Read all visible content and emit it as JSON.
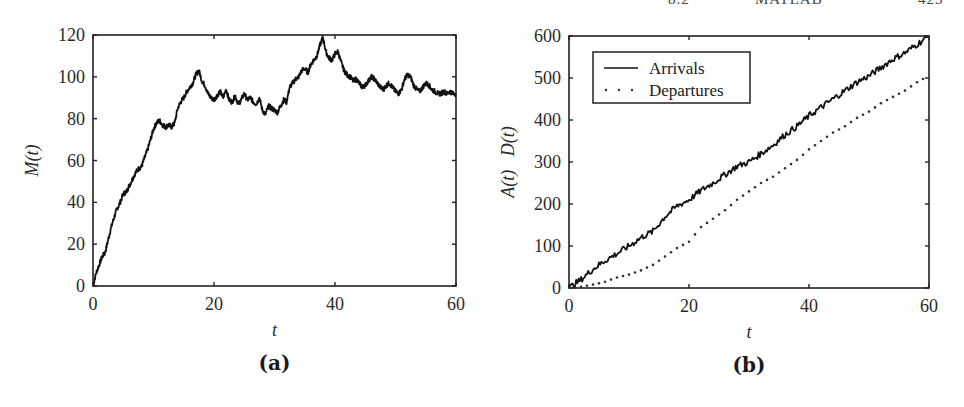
{
  "page_header": {
    "fragments": [
      "8.2",
      "MATLAB",
      "423"
    ]
  },
  "chart_data": [
    {
      "id": "a",
      "type": "line",
      "caption": "(a)",
      "title": "",
      "xlabel": "t",
      "ylabel": "M(t)",
      "xlim": [
        0,
        60
      ],
      "ylim": [
        0,
        120
      ],
      "xticks": [
        0,
        20,
        40,
        60
      ],
      "yticks": [
        0,
        20,
        40,
        60,
        80,
        100,
        120
      ],
      "grid": false,
      "legend": null,
      "box": {
        "left": 93,
        "top": 35,
        "right": 456,
        "bottom": 286
      },
      "series": [
        {
          "name": "M(t)",
          "style": "solid",
          "color": "#111111",
          "x": [
            0,
            0.5,
            1,
            1.5,
            2,
            2.5,
            3,
            3.5,
            4,
            4.5,
            5,
            5.5,
            6,
            6.5,
            7,
            7.5,
            8,
            8.5,
            9,
            9.5,
            10,
            10.5,
            11,
            11.5,
            12,
            12.5,
            13,
            13.5,
            14,
            14.5,
            15,
            15.5,
            16,
            16.5,
            17,
            17.5,
            18,
            18.5,
            19,
            19.5,
            20,
            20.5,
            21,
            21.5,
            22,
            22.5,
            23,
            23.5,
            24,
            24.5,
            25,
            25.5,
            26,
            26.5,
            27,
            27.5,
            28,
            28.5,
            29,
            29.5,
            30,
            30.5,
            31,
            31.5,
            32,
            32.5,
            33,
            33.5,
            34,
            34.5,
            35,
            35.5,
            36,
            36.5,
            37,
            37.5,
            38,
            38.5,
            39,
            39.5,
            40,
            40.5,
            41,
            41.5,
            42,
            42.5,
            43,
            43.5,
            44,
            44.5,
            45,
            45.5,
            46,
            46.5,
            47,
            47.5,
            48,
            48.5,
            49,
            49.5,
            50,
            50.5,
            51,
            51.5,
            52,
            52.5,
            53,
            53.5,
            54,
            54.5,
            55,
            55.5,
            56,
            56.5,
            57,
            57.5,
            58,
            58.5,
            59,
            59.5,
            60
          ],
          "y": [
            0,
            6,
            10,
            14,
            16,
            22,
            28,
            33,
            37,
            40,
            44,
            45,
            48,
            51,
            54,
            56,
            57,
            61,
            65,
            70,
            75,
            78,
            79,
            77,
            76,
            77,
            76,
            78,
            85,
            88,
            90,
            93,
            95,
            97,
            101,
            103,
            98,
            96,
            92,
            90,
            89,
            91,
            93,
            90,
            94,
            89,
            88,
            91,
            87,
            89,
            92,
            89,
            90,
            88,
            87,
            90,
            84,
            82,
            86,
            85,
            84,
            83,
            86,
            89,
            88,
            95,
            97,
            99,
            100,
            103,
            104,
            102,
            106,
            108,
            110,
            115,
            119,
            112,
            109,
            108,
            111,
            112,
            107,
            103,
            101,
            100,
            98,
            99,
            97,
            95,
            96,
            98,
            100,
            99,
            97,
            95,
            94,
            96,
            97,
            95,
            93,
            92,
            94,
            99,
            101,
            100,
            96,
            94,
            93,
            95,
            97,
            96,
            94,
            93,
            92,
            92,
            93,
            92,
            93,
            92,
            92
          ],
          "noise_amplitude": 1.2
        }
      ]
    },
    {
      "id": "b",
      "type": "line",
      "caption": "(b)",
      "title": "",
      "xlabel": "t",
      "ylabel": "A(t)   D(t)",
      "xlim": [
        0,
        60
      ],
      "ylim": [
        0,
        600
      ],
      "xticks": [
        0,
        20,
        40,
        60
      ],
      "yticks": [
        0,
        100,
        200,
        300,
        400,
        500,
        600
      ],
      "grid": false,
      "legend": {
        "position": "upper-left",
        "entries": [
          {
            "label": "Arrivals",
            "style": "solid"
          },
          {
            "label": "Departures",
            "style": "dotted"
          }
        ]
      },
      "box": {
        "left": 569,
        "top": 36,
        "right": 929,
        "bottom": 288
      },
      "series": [
        {
          "name": "Arrivals",
          "style": "solid",
          "color": "#111111",
          "x": [
            0,
            2,
            4,
            6,
            8,
            10,
            12,
            14,
            16,
            18,
            20,
            22,
            24,
            26,
            28,
            30,
            32,
            34,
            36,
            38,
            40,
            42,
            44,
            46,
            48,
            50,
            52,
            54,
            56,
            58,
            60
          ],
          "y": [
            0,
            20,
            45,
            65,
            82,
            100,
            120,
            135,
            170,
            195,
            210,
            232,
            250,
            270,
            290,
            300,
            320,
            340,
            365,
            385,
            410,
            430,
            450,
            470,
            490,
            505,
            525,
            545,
            560,
            580,
            600
          ],
          "noise_amplitude": 1.5
        },
        {
          "name": "Departures",
          "style": "dotted",
          "color": "#333333",
          "x": [
            0,
            2,
            4,
            6,
            8,
            10,
            12,
            14,
            16,
            18,
            20,
            22,
            24,
            26,
            28,
            30,
            32,
            34,
            36,
            38,
            40,
            42,
            44,
            46,
            48,
            50,
            52,
            54,
            56,
            58,
            60
          ],
          "y": [
            0,
            3,
            8,
            15,
            25,
            32,
            42,
            55,
            75,
            95,
            110,
            145,
            165,
            185,
            210,
            230,
            250,
            265,
            285,
            305,
            330,
            350,
            370,
            385,
            405,
            420,
            440,
            455,
            470,
            490,
            505
          ]
        }
      ]
    }
  ]
}
